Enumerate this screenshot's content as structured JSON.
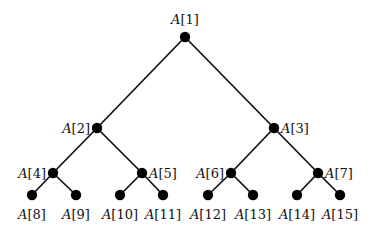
{
  "diagram": {
    "type": "binary-tree",
    "array_name": "A",
    "node_color": "#000000",
    "edge_color": "#111111",
    "nodes": [
      {
        "index": 1,
        "label": "A[1]",
        "x": 185,
        "y": 37,
        "label_pos": "above"
      },
      {
        "index": 2,
        "label": "A[2]",
        "x": 97,
        "y": 128,
        "label_pos": "left"
      },
      {
        "index": 3,
        "label": "A[3]",
        "x": 274,
        "y": 128,
        "label_pos": "right"
      },
      {
        "index": 4,
        "label": "A[4]",
        "x": 53,
        "y": 173,
        "label_pos": "left"
      },
      {
        "index": 5,
        "label": "A[5]",
        "x": 142,
        "y": 173,
        "label_pos": "right"
      },
      {
        "index": 6,
        "label": "A[6]",
        "x": 231,
        "y": 173,
        "label_pos": "left"
      },
      {
        "index": 7,
        "label": "A[7]",
        "x": 318,
        "y": 173,
        "label_pos": "right"
      },
      {
        "index": 8,
        "label": "A[8]",
        "x": 32,
        "y": 195,
        "label_pos": "below"
      },
      {
        "index": 9,
        "label": "A[9]",
        "x": 76,
        "y": 195,
        "label_pos": "below"
      },
      {
        "index": 10,
        "label": "A[10]",
        "x": 120,
        "y": 195,
        "label_pos": "below"
      },
      {
        "index": 11,
        "label": "A[11]",
        "x": 163,
        "y": 195,
        "label_pos": "below"
      },
      {
        "index": 12,
        "label": "A[12]",
        "x": 208,
        "y": 195,
        "label_pos": "below"
      },
      {
        "index": 13,
        "label": "A[13]",
        "x": 253,
        "y": 195,
        "label_pos": "below"
      },
      {
        "index": 14,
        "label": "A[14]",
        "x": 297,
        "y": 195,
        "label_pos": "below"
      },
      {
        "index": 15,
        "label": "A[15]",
        "x": 340,
        "y": 195,
        "label_pos": "below"
      }
    ],
    "edges": [
      [
        1,
        2
      ],
      [
        1,
        3
      ],
      [
        2,
        4
      ],
      [
        2,
        5
      ],
      [
        3,
        6
      ],
      [
        3,
        7
      ],
      [
        4,
        8
      ],
      [
        4,
        9
      ],
      [
        5,
        10
      ],
      [
        5,
        11
      ],
      [
        6,
        12
      ],
      [
        6,
        13
      ],
      [
        7,
        14
      ],
      [
        7,
        15
      ]
    ]
  }
}
